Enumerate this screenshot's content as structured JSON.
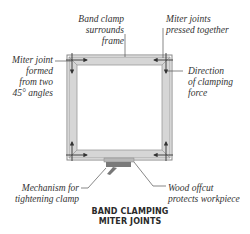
{
  "diagram": {
    "title_line1": "BAND CLAMPING",
    "title_line2": "MITER JOINTS",
    "labels": {
      "band_clamp_line1": "Band clamp",
      "band_clamp_line2": "surrounds frame",
      "miter_pressed_line1": "Miter joints",
      "miter_pressed_line2": "pressed together",
      "miter_formed_line1": "Miter joint",
      "miter_formed_line2": "formed",
      "miter_formed_line3": "from two",
      "miter_formed_line4": "45° angles",
      "direction_line1": "Direction",
      "direction_line2": "of clamping",
      "direction_line3": "force",
      "mechanism_line1": "Mechanism for",
      "mechanism_line2": "tightening clamp",
      "offcut_line1": "Wood offcut",
      "offcut_line2": "protects workpiece"
    },
    "colors": {
      "frame_wood": "#d4d4d4",
      "frame_edge": "#9a9a9a",
      "band": "#6e6e6e",
      "mechanism": "#7a7a7a",
      "arrow": "#333333",
      "text": "#333333"
    }
  }
}
